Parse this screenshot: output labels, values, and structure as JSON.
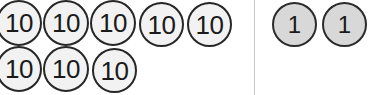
{
  "canvas": {
    "width": 369,
    "height": 95,
    "background": "#ffffff"
  },
  "divider": {
    "name": "place-value-divider",
    "x": 254,
    "y": 0,
    "height": 95,
    "color": "#c9c9c9"
  },
  "groups": [
    {
      "id": "tens-group",
      "name": "tens-place-tokens",
      "value_label": "10",
      "fill": "#f2f2f2",
      "stroke": "#272727",
      "count": 8,
      "diameter": 46,
      "tokens": [
        {
          "label": "10",
          "x": -4,
          "y": 0
        },
        {
          "label": "10",
          "x": 43,
          "y": 0
        },
        {
          "label": "10",
          "x": 90,
          "y": 0
        },
        {
          "label": "10",
          "x": 139,
          "y": 2
        },
        {
          "label": "10",
          "x": 187,
          "y": 2
        },
        {
          "label": "10",
          "x": -4,
          "y": 46
        },
        {
          "label": "10",
          "x": 43,
          "y": 46
        },
        {
          "label": "10",
          "x": 92,
          "y": 48
        }
      ]
    },
    {
      "id": "ones-group",
      "name": "ones-place-tokens",
      "value_label": "1",
      "fill": "#d8d8d8",
      "stroke": "#2b2b2b",
      "count": 2,
      "diameter": 45,
      "tokens": [
        {
          "label": "1",
          "x": 272,
          "y": 2
        },
        {
          "label": "1",
          "x": 322,
          "y": 2
        }
      ]
    }
  ],
  "totals": {
    "tens_count": 8,
    "ones_count": 2,
    "tens_value": 80,
    "ones_value": 2,
    "sum": 82
  }
}
